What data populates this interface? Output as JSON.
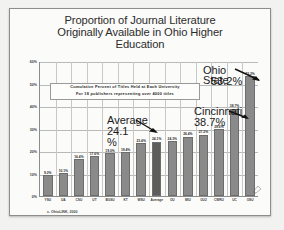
{
  "slide": {
    "title_lines": [
      "Proportion of Journal Literature",
      "Originally Available in Ohio Higher",
      "Education"
    ],
    "source_note": "c. OhioLINK, 2000"
  },
  "annotation_box": {
    "line1": "Cumulative Percent of Titles Held at Each University",
    "line2": "For 18 publishers representing over 4000 titles"
  },
  "callouts": [
    {
      "name": "ohio-state",
      "line1": "Ohio",
      "line2": "State",
      "value": "53.2%"
    },
    {
      "name": "cincinnati",
      "line1": "Cincinnati",
      "value": "38.7%"
    },
    {
      "name": "average",
      "line1": "Average",
      "value": "24.1",
      "unit": "%"
    }
  ],
  "chart_data": {
    "type": "bar",
    "title": "Proportion of Journal Literature Originally Available in Ohio Higher Education",
    "subtitle": "Cumulative Percent of Titles Held at Each University For 18 publishers representing over 4000 titles",
    "xlabel": "",
    "ylabel": "",
    "ylim": [
      0,
      60
    ],
    "yticks": [
      "0%",
      "10%",
      "20%",
      "30%",
      "40%",
      "50%",
      "60%"
    ],
    "ytick_values": [
      0,
      10,
      20,
      30,
      40,
      50,
      60
    ],
    "grid": true,
    "legend": "none",
    "categories": [
      "YSU",
      "UA",
      "CSU",
      "UT",
      "BGSU",
      "KT",
      "WSU",
      "Average",
      "OU",
      "MIU",
      "OU2",
      "CWRU",
      "UC",
      "OSU"
    ],
    "values": [
      9.2,
      10.1,
      16.4,
      17.6,
      19.0,
      19.4,
      23.4,
      24.1,
      24.3,
      26.4,
      27.2,
      29.6,
      38.7,
      53.2
    ],
    "data_labels": [
      "9.2%",
      "10.1%",
      "16.4%",
      "17.6%",
      "19.0%",
      "19.4%",
      "23.4%",
      "24.1%",
      "24.3%",
      "26.4%",
      "27.2%",
      "29.6%",
      "38.7%",
      "53.2%"
    ],
    "highlight_index": 7,
    "bar_color": "#8a8a8a",
    "highlight_color": "#5d5d5d",
    "annotations": [
      {
        "text": "Ohio State 53.2%",
        "points_to": "OSU"
      },
      {
        "text": "Cincinnati 38.7%",
        "points_to": "UC"
      },
      {
        "text": "Average 24.1%",
        "points_to": "Average"
      }
    ]
  }
}
